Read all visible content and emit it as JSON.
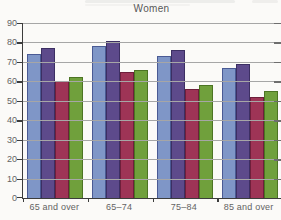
{
  "title": "Women",
  "colors": {
    "background": "#fbfaf8",
    "gridline": "#a6a6a6",
    "axis": "#3c3c3c",
    "tick": "#6e6e6e",
    "label_text": "#636363",
    "title_text": "#575757"
  },
  "chart_data": {
    "type": "bar",
    "title": "Women",
    "categories": [
      "65 and over",
      "65–74",
      "75–84",
      "85 and over"
    ],
    "series": [
      {
        "name": "blue",
        "color": "#7f96c7",
        "border": "#4a5a94",
        "values": [
          74,
          78,
          73,
          67
        ]
      },
      {
        "name": "purple",
        "color": "#5d4a8b",
        "border": "#3c2f63",
        "values": [
          77,
          81,
          76,
          69
        ]
      },
      {
        "name": "maroon",
        "color": "#9e3456",
        "border": "#6e1f3b",
        "values": [
          60,
          65,
          56,
          52
        ]
      },
      {
        "name": "green",
        "color": "#70a03c",
        "border": "#4c7423",
        "values": [
          62,
          66,
          58,
          55
        ]
      }
    ],
    "ylim": [
      0,
      90
    ],
    "yticks": [
      0,
      10,
      20,
      30,
      40,
      50,
      60,
      70,
      80,
      90
    ],
    "xlabel": "",
    "ylabel": "",
    "grid": true,
    "legend_position": "none"
  }
}
